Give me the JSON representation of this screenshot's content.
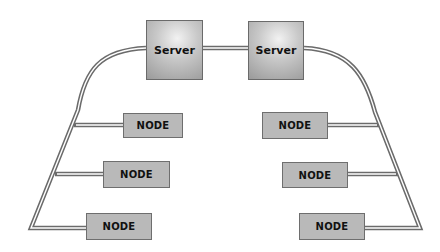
{
  "diagram": {
    "type": "network-topology",
    "servers": [
      {
        "label": "Server",
        "x": 146,
        "y": 20,
        "w": 57,
        "h": 60
      },
      {
        "label": "Server",
        "x": 248,
        "y": 21,
        "w": 56,
        "h": 59
      }
    ],
    "nodes_left": [
      {
        "label": "NODE",
        "x": 123,
        "y": 113,
        "w": 60,
        "h": 25
      },
      {
        "label": "NODE",
        "x": 103,
        "y": 161,
        "w": 67,
        "h": 27
      },
      {
        "label": "NODE",
        "x": 86,
        "y": 213,
        "w": 66,
        "h": 27
      }
    ],
    "nodes_right": [
      {
        "label": "NODE",
        "x": 262,
        "y": 112,
        "w": 66,
        "h": 27
      },
      {
        "label": "NODE",
        "x": 282,
        "y": 162,
        "w": 66,
        "h": 26
      },
      {
        "label": "NODE",
        "x": 299,
        "y": 213,
        "w": 66,
        "h": 27
      }
    ],
    "connections": [
      {
        "from": "server-left",
        "to": "server-right"
      },
      {
        "from": "server-left",
        "to": "left-bus"
      },
      {
        "from": "server-right",
        "to": "right-bus"
      },
      {
        "from": "left-bus",
        "to": "node-left-1"
      },
      {
        "from": "left-bus",
        "to": "node-left-2"
      },
      {
        "from": "left-bus",
        "to": "node-left-3"
      },
      {
        "from": "right-bus",
        "to": "node-right-1"
      },
      {
        "from": "right-bus",
        "to": "node-right-2"
      },
      {
        "from": "right-bus",
        "to": "node-right-3"
      }
    ],
    "colors": {
      "cable_outer": "#6b6b6b",
      "cable_inner": "#ffffff",
      "node_fill": "#b9b9b9",
      "server_fill": "#bdbdbd"
    }
  }
}
